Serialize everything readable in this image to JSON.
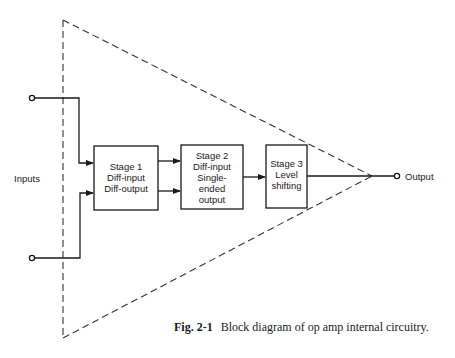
{
  "diagram": {
    "title": "Block diagram of op amp internal circuitry",
    "inputs_label": "Inputs",
    "output_label": "Output",
    "stages": [
      {
        "lines": [
          "Stage 1",
          "Diff-input",
          "Diff-output"
        ]
      },
      {
        "lines": [
          "Stage 2",
          "Diff-input",
          "Single-",
          "ended",
          "output"
        ]
      },
      {
        "lines": [
          "Stage 3",
          "Level",
          "shifting"
        ]
      }
    ],
    "colors": {
      "stroke": "#1a1a1a",
      "background": "#ffffff"
    }
  },
  "caption": {
    "figure_number": "Fig. 2-1",
    "text": "Block diagram of op amp internal circuitry."
  }
}
